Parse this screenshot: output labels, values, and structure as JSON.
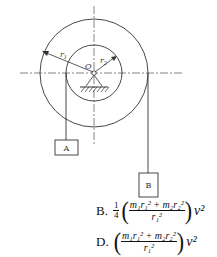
{
  "figure": {
    "center_label": "O",
    "outer_radius_label": "r1",
    "inner_radius_label": "r2",
    "block_a_label": "A",
    "block_b_label": "B",
    "line_color": "#333333"
  },
  "options": [
    {
      "label": "B.",
      "coefficient_num": "1",
      "coefficient_den": "4",
      "numerator": "m₁r₁² + m₂r₂²",
      "denominator": "r₁²",
      "suffix": "v²"
    },
    {
      "label": "D.",
      "coefficient_num": "",
      "coefficient_den": "",
      "numerator": "m₁r₁² + m₂r₂²",
      "denominator": "r₁²",
      "suffix": "v²"
    }
  ]
}
